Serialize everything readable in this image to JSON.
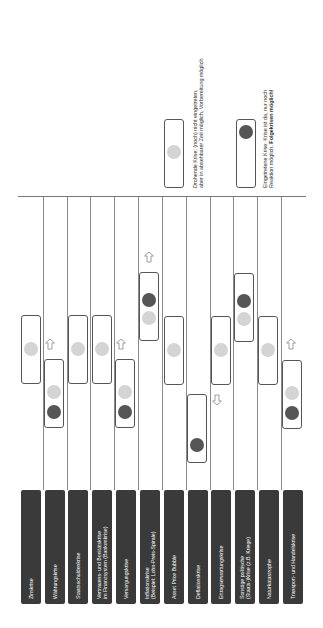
{
  "crises": [
    {
      "label_lines": [
        "Zinskrise"
      ]
    },
    {
      "label_lines": [
        "Währungskrise"
      ]
    },
    {
      "label_lines": [
        "Staatsschuldenkrise"
      ]
    },
    {
      "label_lines": [
        "Vertrauens- und Bonitätskrise",
        "im Finanzsystem (Bankenkrise)"
      ]
    },
    {
      "label_lines": [
        "Versorgungskrise"
      ]
    },
    {
      "label_lines": [
        "Inflationskrise",
        "(Beispiel: Lohn-Preis-Spirale)"
      ]
    },
    {
      "label_lines": [
        "Asset Price Bubble"
      ]
    },
    {
      "label_lines": [
        "Deflationskrise"
      ]
    },
    {
      "label_lines": [
        "Ertragserwartungskrise"
      ]
    },
    {
      "label_lines": [
        "Sonstige politische",
        "(Staats-)Krise (z.B. Kriege)"
      ]
    },
    {
      "label_lines": [
        "Naturkatastrophe"
      ]
    },
    {
      "label_lines": [
        "Transport- und Handelskrise"
      ]
    }
  ],
  "legend": {
    "threatening": {
      "line1": "Drohende Krise: (noch) nicht eingetreten,",
      "line2": "aber in absehbarer Zeit möglich, Vorbereitung möglich"
    },
    "occurred": {
      "line1": "Eingetretene Krise: Krise ist da, nur noch",
      "line2_prefix": "Reaktion möglich, ",
      "line2_bold": "Folgekrisen möglich!"
    }
  },
  "colors": {
    "label_bg": "#3a3a3a",
    "threatening_dot": "#d4d4d4",
    "occurred_dot": "#555555"
  }
}
